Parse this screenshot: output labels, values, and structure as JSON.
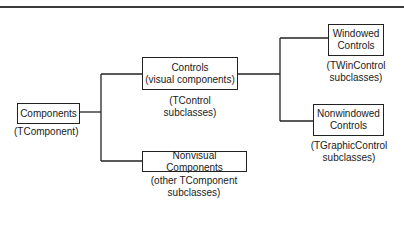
{
  "diagram": {
    "nodes": {
      "components": {
        "label": "Components",
        "sublabel": "(TComponent)"
      },
      "controls": {
        "label_line1": "Controls",
        "label_line2": "(visual components)",
        "sublabel_line1": "(TControl",
        "sublabel_line2": "subclasses)"
      },
      "nonvisual": {
        "label": "Nonvisual Components",
        "sublabel_line1": "(other TComponent",
        "sublabel_line2": "subclasses)"
      },
      "windowed": {
        "label_line1": "Windowed",
        "label_line2": "Controls",
        "sublabel_line1": "(TWinControl",
        "sublabel_line2": "subclasses)"
      },
      "nonwindowed": {
        "label_line1": "Nonwindowed",
        "label_line2": "Controls",
        "sublabel_line1": "(TGraphicControl",
        "sublabel_line2": "subclasses)"
      }
    },
    "edges": [
      {
        "from": "components",
        "to": "controls"
      },
      {
        "from": "components",
        "to": "nonvisual"
      },
      {
        "from": "controls",
        "to": "windowed"
      },
      {
        "from": "controls",
        "to": "nonwindowed"
      }
    ]
  }
}
